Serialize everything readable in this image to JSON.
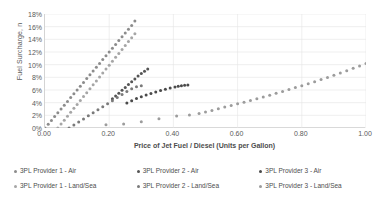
{
  "chart_data": {
    "type": "scatter",
    "title": "",
    "xlabel": "Price of Jet Fuel / Diesel (Units per Gallon)",
    "ylabel": "Fuel Surcharge, n",
    "xlim": [
      0.0,
      1.0
    ],
    "ylim": [
      0.0,
      0.18
    ],
    "xticks": [
      "0.00",
      "0.20",
      "0.40",
      "0.60",
      "0.80",
      "1.00"
    ],
    "xtick_values": [
      0.0,
      0.2,
      0.4,
      0.6,
      0.8,
      1.0
    ],
    "yticks": [
      "0%",
      "2%",
      "4%",
      "6%",
      "8%",
      "10%",
      "12%",
      "14%",
      "16%",
      "18%"
    ],
    "ytick_values": [
      0.0,
      0.02,
      0.04,
      0.06,
      0.08,
      0.1,
      0.12,
      0.14,
      0.16,
      0.18
    ],
    "grid": true,
    "legend_position": "bottom",
    "series": [
      {
        "name": "3PL Provider 1 - Air",
        "color": "#8c8c8c",
        "marker": "dot",
        "points": [
          [
            0.0,
            0.0
          ],
          [
            0.01,
            0.006
          ],
          [
            0.02,
            0.012
          ],
          [
            0.03,
            0.018
          ],
          [
            0.04,
            0.024
          ],
          [
            0.05,
            0.03
          ],
          [
            0.06,
            0.036
          ],
          [
            0.07,
            0.042
          ],
          [
            0.08,
            0.048
          ],
          [
            0.09,
            0.054
          ],
          [
            0.1,
            0.06
          ],
          [
            0.11,
            0.066
          ],
          [
            0.12,
            0.072
          ],
          [
            0.13,
            0.078
          ],
          [
            0.14,
            0.084
          ],
          [
            0.15,
            0.09
          ],
          [
            0.16,
            0.096
          ],
          [
            0.17,
            0.102
          ],
          [
            0.18,
            0.108
          ],
          [
            0.19,
            0.114
          ],
          [
            0.2,
            0.12
          ],
          [
            0.21,
            0.126
          ],
          [
            0.22,
            0.132
          ],
          [
            0.23,
            0.138
          ],
          [
            0.24,
            0.144
          ],
          [
            0.25,
            0.15
          ],
          [
            0.26,
            0.156
          ],
          [
            0.27,
            0.162
          ],
          [
            0.28,
            0.169
          ]
        ]
      },
      {
        "name": "3PL Provider 1 - Land/Sea",
        "color": "#a6a6a6",
        "marker": "dot",
        "points": [
          [
            0.04,
            0.0
          ],
          [
            0.05,
            0.0062
          ],
          [
            0.06,
            0.0124
          ],
          [
            0.07,
            0.0186
          ],
          [
            0.08,
            0.0248
          ],
          [
            0.09,
            0.031
          ],
          [
            0.1,
            0.0372
          ],
          [
            0.11,
            0.0434
          ],
          [
            0.12,
            0.0496
          ],
          [
            0.13,
            0.0558
          ],
          [
            0.14,
            0.062
          ],
          [
            0.15,
            0.0682
          ],
          [
            0.16,
            0.0744
          ],
          [
            0.17,
            0.0806
          ],
          [
            0.18,
            0.0868
          ],
          [
            0.19,
            0.093
          ],
          [
            0.2,
            0.0992
          ],
          [
            0.21,
            0.1054
          ],
          [
            0.22,
            0.1116
          ],
          [
            0.23,
            0.1178
          ],
          [
            0.24,
            0.124
          ],
          [
            0.25,
            0.1302
          ],
          [
            0.26,
            0.1364
          ],
          [
            0.27,
            0.1426
          ],
          [
            0.28,
            0.149
          ]
        ]
      },
      {
        "name": "3PL Provider 2 - Air",
        "color": "#555555",
        "marker": "dot",
        "points": [
          [
            0.21,
            0.046
          ],
          [
            0.22,
            0.0505
          ],
          [
            0.23,
            0.055
          ],
          [
            0.24,
            0.0595
          ],
          [
            0.25,
            0.064
          ],
          [
            0.26,
            0.0685
          ],
          [
            0.27,
            0.073
          ],
          [
            0.28,
            0.0775
          ],
          [
            0.29,
            0.082
          ],
          [
            0.3,
            0.086
          ],
          [
            0.31,
            0.0895
          ],
          [
            0.32,
            0.093
          ]
        ]
      },
      {
        "name": "3PL Provider 2 - Land/Sea",
        "color": "#7a7a7a",
        "marker": "dot",
        "points": [
          [
            0.075,
            0.0
          ],
          [
            0.09,
            0.0048
          ],
          [
            0.105,
            0.0096
          ],
          [
            0.12,
            0.0144
          ],
          [
            0.135,
            0.0192
          ],
          [
            0.15,
            0.024
          ],
          [
            0.165,
            0.0288
          ],
          [
            0.18,
            0.0336
          ],
          [
            0.195,
            0.0384
          ],
          [
            0.21,
            0.0432
          ],
          [
            0.225,
            0.048
          ],
          [
            0.24,
            0.0528
          ],
          [
            0.255,
            0.0576
          ],
          [
            0.27,
            0.062
          ],
          [
            0.285,
            0.0652
          ],
          [
            0.3,
            0.0668
          ]
        ]
      },
      {
        "name": "3PL Provider 3 - Air",
        "color": "#4a4a4a",
        "marker": "dot",
        "points": [
          [
            0.255,
            0.0395
          ],
          [
            0.27,
            0.043
          ],
          [
            0.285,
            0.0465
          ],
          [
            0.3,
            0.0495
          ],
          [
            0.315,
            0.052
          ],
          [
            0.33,
            0.0545
          ],
          [
            0.345,
            0.057
          ],
          [
            0.36,
            0.0592
          ],
          [
            0.375,
            0.0612
          ],
          [
            0.39,
            0.063
          ],
          [
            0.405,
            0.0648
          ],
          [
            0.415,
            0.066
          ],
          [
            0.425,
            0.0668
          ],
          [
            0.435,
            0.0674
          ],
          [
            0.445,
            0.0678
          ]
        ]
      },
      {
        "name": "3PL Provider 3 - Land/Sea",
        "color": "#9c9c9c",
        "marker": "dot",
        "points": [
          [
            0.19,
            0.005
          ],
          [
            0.245,
            0.0065
          ],
          [
            0.3,
            0.0098
          ],
          [
            0.355,
            0.0148
          ],
          [
            0.41,
            0.0188
          ],
          [
            0.45,
            0.0205
          ],
          [
            0.48,
            0.023
          ],
          [
            0.5,
            0.0252
          ],
          [
            0.52,
            0.0278
          ],
          [
            0.54,
            0.0305
          ],
          [
            0.56,
            0.033
          ],
          [
            0.58,
            0.0355
          ],
          [
            0.6,
            0.0382
          ],
          [
            0.62,
            0.0408
          ],
          [
            0.64,
            0.0435
          ],
          [
            0.66,
            0.0462
          ],
          [
            0.68,
            0.049
          ],
          [
            0.7,
            0.0518
          ],
          [
            0.72,
            0.0548
          ],
          [
            0.74,
            0.0578
          ],
          [
            0.76,
            0.0608
          ],
          [
            0.78,
            0.0638
          ],
          [
            0.8,
            0.0668
          ],
          [
            0.82,
            0.07
          ],
          [
            0.84,
            0.0732
          ],
          [
            0.86,
            0.0765
          ],
          [
            0.88,
            0.0798
          ],
          [
            0.9,
            0.0832
          ],
          [
            0.92,
            0.0868
          ],
          [
            0.94,
            0.0905
          ],
          [
            0.96,
            0.0942
          ],
          [
            0.98,
            0.098
          ],
          [
            1.0,
            0.102
          ]
        ]
      }
    ]
  },
  "legend": {
    "items": [
      {
        "label": "3PL Provider 1 - Air",
        "color": "#8c8c8c"
      },
      {
        "label": "3PL Provider 1 - Land/Sea",
        "color": "#a6a6a6"
      },
      {
        "label": "3PL Provider 2 - Air",
        "color": "#555555"
      },
      {
        "label": "3PL Provider 2 - Land/Sea",
        "color": "#7a7a7a"
      },
      {
        "label": "3PL Provider 3 - Air",
        "color": "#4a4a4a"
      },
      {
        "label": "3PL Provider 3 - Land/Sea",
        "color": "#9c9c9c"
      }
    ]
  },
  "style": {
    "grid_color": "#e4e4e4",
    "axis_color": "#d4d4d4",
    "text_color": "#5a5a5a"
  }
}
